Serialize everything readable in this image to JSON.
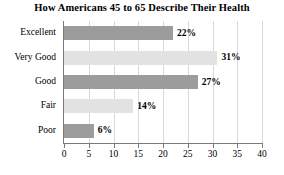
{
  "chart_data": {
    "type": "bar",
    "orientation": "horizontal",
    "title": "How Americans 45 to 65 Describe Their Health",
    "xlabel": "",
    "ylabel": "",
    "categories": [
      "Excellent",
      "Very Good",
      "Good",
      "Fair",
      "Poor"
    ],
    "values": [
      22,
      31,
      27,
      14,
      6
    ],
    "value_labels": [
      "22%",
      "31%",
      "27%",
      "14%",
      "6%"
    ],
    "bar_colors": [
      "#9c9c9c",
      "#e2e2e2",
      "#9c9c9c",
      "#e2e2e2",
      "#9c9c9c"
    ],
    "xlim": [
      0,
      40
    ],
    "xticks": [
      0,
      5,
      10,
      15,
      20,
      25,
      30,
      35,
      40
    ],
    "xtick_labels": [
      "0",
      "5",
      "10",
      "15",
      "20",
      "25",
      "30",
      "35",
      "40"
    ],
    "grid": "vertical",
    "legend": "none"
  },
  "axis": {
    "line_color": "#7a7a7a",
    "grid_color": "#d9d9d9"
  }
}
